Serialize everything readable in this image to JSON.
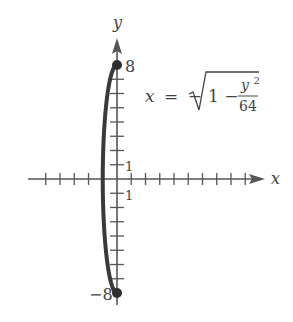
{
  "chart_data": {
    "type": "line",
    "title": "",
    "equation": {
      "lhs": "x",
      "equals": "=",
      "sign": "−",
      "radicand_lead": "1 −",
      "numerator": "y",
      "numerator_exp": "2",
      "denominator": "64",
      "full": "x = −√(1 − y²/64)"
    },
    "xlabel": "x",
    "ylabel": "y",
    "tick_labels": {
      "y_top": "8",
      "y_bottom": "−8",
      "x_one": "1",
      "y_one": "1"
    },
    "xlim": [
      -6,
      10.5
    ],
    "ylim": [
      -9,
      10
    ],
    "x_ticks": [
      -5,
      -4,
      -3,
      -2,
      -1,
      1,
      2,
      3,
      4,
      5,
      6,
      7,
      8,
      9
    ],
    "y_ticks": [
      -7,
      -6,
      -5,
      -4,
      -3,
      -2,
      -1,
      1,
      2,
      3,
      4,
      5,
      6,
      7
    ],
    "grid": false,
    "series": [
      {
        "name": "x = −√(1 − y²/64)",
        "points": [
          {
            "x": 0,
            "y": 8
          },
          {
            "x": -0.484,
            "y": 7
          },
          {
            "x": -0.661,
            "y": 6
          },
          {
            "x": -0.781,
            "y": 5
          },
          {
            "x": -0.866,
            "y": 4
          },
          {
            "x": -0.927,
            "y": 3
          },
          {
            "x": -0.968,
            "y": 2
          },
          {
            "x": -0.992,
            "y": 1
          },
          {
            "x": -1,
            "y": 0
          },
          {
            "x": -0.992,
            "y": -1
          },
          {
            "x": -0.968,
            "y": -2
          },
          {
            "x": -0.927,
            "y": -3
          },
          {
            "x": -0.866,
            "y": -4
          },
          {
            "x": -0.781,
            "y": -5
          },
          {
            "x": -0.661,
            "y": -6
          },
          {
            "x": -0.484,
            "y": -7
          },
          {
            "x": 0,
            "y": -8
          }
        ],
        "endpoints": [
          {
            "x": 0,
            "y": 8
          },
          {
            "x": 0,
            "y": -8
          }
        ],
        "endpoint_style": "filled-dot"
      }
    ]
  }
}
